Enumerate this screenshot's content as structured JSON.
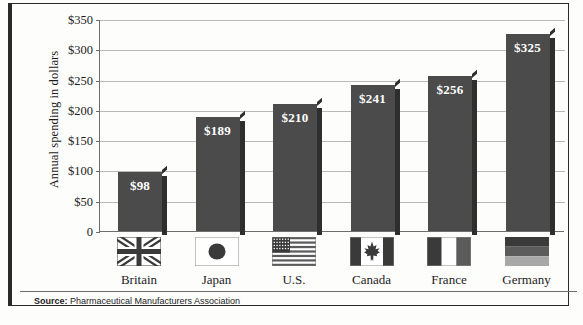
{
  "chart_data": {
    "type": "bar",
    "title": "",
    "xlabel": "",
    "ylabel": "Annual spending in dollars",
    "categories": [
      "Britain",
      "Japan",
      "U.S.",
      "Canada",
      "France",
      "Germany"
    ],
    "values": [
      98,
      189,
      210,
      241,
      256,
      325
    ],
    "value_labels": [
      "$98",
      "$189",
      "$210",
      "$241",
      "$256",
      "$325"
    ],
    "ylim": [
      0,
      350
    ],
    "ytick_values": [
      0,
      50,
      100,
      150,
      200,
      250,
      300,
      350
    ],
    "ytick_labels": [
      "0",
      "$50",
      "$100",
      "$150",
      "$200",
      "$250",
      "$300",
      "$350"
    ],
    "grid": true,
    "legend": "none",
    "series": [
      {
        "name": "Annual spending in dollars",
        "values": [
          98,
          189,
          210,
          241,
          256,
          325
        ],
        "color": "#4b4b4b"
      }
    ],
    "category_icons": [
      "flag-britain",
      "flag-japan",
      "flag-usa",
      "flag-canada",
      "flag-france",
      "flag-germany"
    ]
  },
  "axis": {
    "y_title": "Annual spending in dollars"
  },
  "source": {
    "label": "Source:",
    "text": "Pharmaceutical Manufacturers Association"
  },
  "colors": {
    "bar": "#4b4b4b",
    "bar_shadow": "#2e2e2e",
    "gridline": "#b9b9b9",
    "axis": "#6d6d6d",
    "frame": "#2a2a2a",
    "background": "#fdfdfc",
    "value_text": "#ffffff",
    "label_text": "#1c1c1c"
  }
}
